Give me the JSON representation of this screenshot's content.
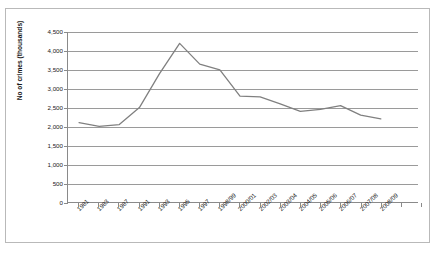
{
  "chart_data": {
    "type": "line",
    "title": "",
    "xlabel": "",
    "ylabel": "No of crimes (thousands)",
    "ylim": [
      0,
      4500
    ],
    "yticks": [
      0,
      500,
      1000,
      1500,
      2000,
      2500,
      3000,
      3500,
      4000,
      4500
    ],
    "ytick_labels": [
      "0",
      "500",
      "1,000",
      "1,500",
      "2,000",
      "2,500",
      "3,000",
      "3,500",
      "4,000",
      "4,500"
    ],
    "grid": true,
    "legend_position": "none",
    "categories": [
      "1981",
      "1983",
      "1987",
      "1991",
      "1993",
      "1995",
      "1997",
      "1998/99",
      "2000/01",
      "2002/03",
      "2003/04",
      "2004/05",
      "2005/06",
      "2006/07",
      "2007/08",
      "2008/09"
    ],
    "series": [
      {
        "name": "No of crimes (thousands)",
        "values": [
          2100,
          2000,
          2050,
          2500,
          3400,
          4200,
          3650,
          3500,
          2800,
          2780,
          2600,
          2400,
          2450,
          2550,
          2300,
          2200
        ]
      }
    ],
    "line_color": "#808080",
    "annotations": []
  },
  "axes": {
    "ytitle": "No of crimes (thousands)"
  }
}
